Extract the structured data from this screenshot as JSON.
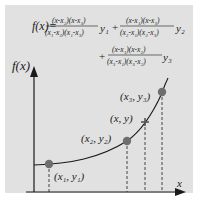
{
  "formula": {
    "lhs": "f(x)=",
    "term1": {
      "num": "(x-x₂)(x-x₃)",
      "den": "(x₁-x₂)(x₁-x₃)",
      "y": "y₁"
    },
    "plus1": "+",
    "term2": {
      "num": "(x-x₁)(x-x₃)",
      "den": "(x₂-x₁)(x₂-x₃)",
      "y": "y₂"
    },
    "plus2": "+",
    "term3": {
      "num": "(x-x₁)(x-x₂)",
      "den": "(x₃-x₁)(x₃-x₂)",
      "y": "y₃"
    }
  },
  "axes": {
    "y_label": "f(x)",
    "x_label": "x"
  },
  "points": [
    {
      "label": "(x₁, y₁)"
    },
    {
      "label": "(x₂, y₂)"
    },
    {
      "label": "(x, y)"
    },
    {
      "label": "(x₃, y₃)"
    }
  ],
  "colors": {
    "panel": "#e1e1e1",
    "ink": "#1a1a1a",
    "point": "#6e6e6e"
  }
}
